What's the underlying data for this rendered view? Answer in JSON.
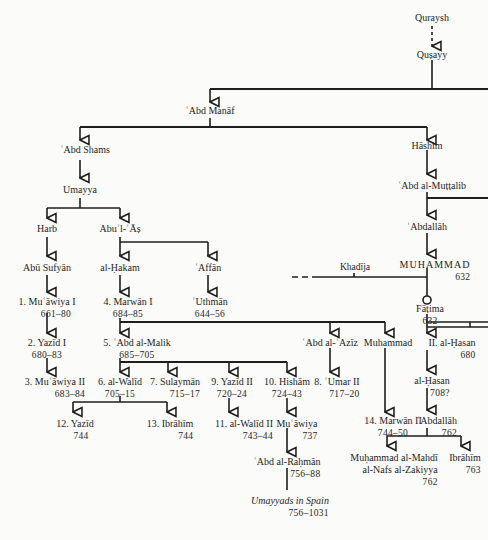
{
  "nodes": {
    "quraysh": {
      "name": "Quraysh"
    },
    "qusayy": {
      "name": "Quṣayy"
    },
    "abd_manaf": {
      "name": "ʿAbd Manāf"
    },
    "abd_shams": {
      "name": "ʿAbd Shams"
    },
    "hashim": {
      "name": "Hāshim"
    },
    "umayya": {
      "name": "Umayya"
    },
    "abd_al_muttalib": {
      "name": "ʿAbd al-Muṭṭalib"
    },
    "harb": {
      "name": "Harb"
    },
    "abul_as": {
      "name": "Abuʾl-ʿĀṣ"
    },
    "abdallah_father": {
      "name": "ʿAbdallāh"
    },
    "abu_sufyan": {
      "name": "Abū Sufyān"
    },
    "al_hakam": {
      "name": "al-Ḥakam"
    },
    "affan": {
      "name": "ʿAffān"
    },
    "khadija": {
      "name": "Khadīja"
    },
    "muhammad": {
      "name": "MUHAMMAD",
      "dates": "632"
    },
    "muawiya_1": {
      "name": "1. Muʿāwiya I",
      "dates": "661–80"
    },
    "marwan_1": {
      "name": "4. Marwān I",
      "dates": "684–85"
    },
    "uthman": {
      "name": "ʿUthmān",
      "dates": "644–56"
    },
    "fatima": {
      "name": "Fāṭima",
      "dates": "632"
    },
    "yazid_1": {
      "name": "2. Yazīd I",
      "dates": "680–83"
    },
    "abd_al_malik": {
      "name": "5. ʿAbd al-Malik",
      "dates": "685–705"
    },
    "abd_al_aziz": {
      "name": "ʿAbd al-ʿAzīz"
    },
    "muhammad_b_marwan": {
      "name": "Muhammad"
    },
    "al_hasan_2": {
      "name": "II. al-Ḥasan",
      "dates": "680"
    },
    "muawiya_2": {
      "name": "3. Muʿāwiya II",
      "dates": "683–84"
    },
    "al_walid_1": {
      "name": "6. al-Walīd",
      "dates": "705–15"
    },
    "sulayman": {
      "name": "7. Sulaymān",
      "dates": "715–17"
    },
    "yazid_2": {
      "name": "9. Yazīd II",
      "dates": "720–24"
    },
    "hisham": {
      "name": "10. Hishām",
      "dates": "724–43"
    },
    "umar_2": {
      "name": "8. ʿUmar II",
      "dates": "717–20"
    },
    "al_hasan_b_hasan": {
      "name": "al-Ḥasan",
      "dates": "708?"
    },
    "al_walid_2": {
      "name": "11. al-Walīd II",
      "dates": "743–44"
    },
    "muawiya_b_hisham": {
      "name": "Muʿāwiya",
      "dates": "737"
    },
    "marwan_2": {
      "name": "14. Marwān II",
      "dates": "744–50"
    },
    "abdallah_b_hasan": {
      "name": "ʿAbdallāh",
      "dates": "762"
    },
    "yazid_3": {
      "name": "12. Yazīd",
      "dates": "744"
    },
    "ibrahim_13": {
      "name": "13. Ibrāhīm",
      "dates": "744"
    },
    "abd_al_rahman": {
      "name": "ʿAbd al-Raḥmān",
      "dates": "756–88"
    },
    "muhammad_al_mahdi": {
      "name": "Muḥammad al-Mahdī",
      "name2": "al-Nafs al-Zakiyya",
      "dates": "762"
    },
    "ibrahim_b_abdallah": {
      "name": "Ibrāhīm",
      "dates": "763"
    },
    "umayyads_spain": {
      "name": "Umayyads in Spain",
      "dates": "756–1031"
    }
  }
}
